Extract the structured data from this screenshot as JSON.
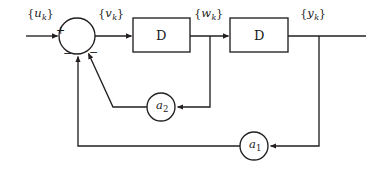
{
  "figure": {
    "type": "block-diagram",
    "background_color": "#ffffff",
    "line_color": "#231f20",
    "text_color": "#1a1a1a"
  },
  "signals": {
    "input": {
      "base": "u",
      "subscript": "k",
      "open": "{",
      "close": "}"
    },
    "error": {
      "base": "v",
      "subscript": "k",
      "open": "{",
      "close": "}"
    },
    "mid": {
      "base": "w",
      "subscript": "k",
      "open": "{",
      "close": "}"
    },
    "output": {
      "base": "y",
      "subscript": "k",
      "open": "{",
      "close": "}"
    }
  },
  "blocks": [
    {
      "id": "delay-1",
      "label": "D",
      "x": 133,
      "y": 18,
      "w": 57,
      "h": 34
    },
    {
      "id": "delay-2",
      "label": "D",
      "x": 230,
      "y": 18,
      "w": 58,
      "h": 34
    }
  ],
  "summing_junction": {
    "id": "summing-junction",
    "cx": 77,
    "cy": 36,
    "r": 18,
    "signs": [
      {
        "id": "plus-input",
        "text": "+",
        "x": 56,
        "y": 25
      },
      {
        "id": "minus-left",
        "text": "−",
        "x": 63,
        "y": 52
      },
      {
        "id": "minus-right",
        "text": "−",
        "x": 89,
        "y": 51
      }
    ]
  },
  "gains": [
    {
      "id": "gain-a2",
      "base": "a",
      "subscript": "2",
      "cx": 161,
      "cy": 107,
      "r": 14
    },
    {
      "id": "gain-a1",
      "base": "a",
      "subscript": "1",
      "cx": 254,
      "cy": 146,
      "r": 14
    }
  ],
  "label_positions": {
    "input": {
      "x": 27,
      "y": 8
    },
    "error": {
      "x": 98,
      "y": 8
    },
    "mid": {
      "x": 194,
      "y": 8
    },
    "output": {
      "x": 300,
      "y": 8
    }
  }
}
